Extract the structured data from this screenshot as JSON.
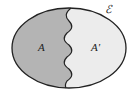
{
  "diagram": {
    "type": "venn",
    "universe_label": "ℰ",
    "regions": [
      {
        "label": "A",
        "fill": "#b4b4b4"
      },
      {
        "label": "A'",
        "fill": "#ececec"
      }
    ],
    "outline_color": "#222222"
  }
}
